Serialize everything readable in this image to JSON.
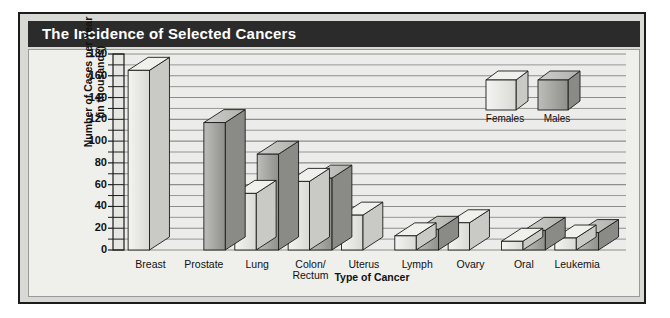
{
  "chart_data": {
    "type": "bar",
    "title": "The Incidence of Selected Cancers",
    "xlabel": "Type of Cancer",
    "ylabel": "Number of Cases per Year\n(in thousands)",
    "ylabel_line1": "Number of Cases per Year",
    "ylabel_line2": "(in thousands)",
    "categories": [
      "Breast",
      "Prostate",
      "Lung",
      "Colon/\nRectum",
      "Uterus",
      "Lymph",
      "Ovary",
      "Oral",
      "Leukemia"
    ],
    "category_labels": [
      {
        "line1": "Breast",
        "line2": ""
      },
      {
        "line1": "Prostate",
        "line2": ""
      },
      {
        "line1": "Lung",
        "line2": ""
      },
      {
        "line1": "Colon/",
        "line2": "Rectum"
      },
      {
        "line1": "Uterus",
        "line2": ""
      },
      {
        "line1": "Lymph",
        "line2": ""
      },
      {
        "line1": "Ovary",
        "line2": ""
      },
      {
        "line1": "Oral",
        "line2": ""
      },
      {
        "line1": "Leukemia",
        "line2": ""
      }
    ],
    "series": [
      {
        "name": "Females",
        "color": "#e4e4e0",
        "values": [
          165,
          null,
          52,
          63,
          32,
          13,
          25,
          8,
          11
        ]
      },
      {
        "name": "Males",
        "color": "#a8a8a4",
        "values": [
          null,
          117,
          88,
          66,
          null,
          19,
          null,
          18,
          16
        ]
      }
    ],
    "yticks": [
      0,
      20,
      40,
      60,
      80,
      100,
      120,
      140,
      160,
      180
    ],
    "ylim": [
      0,
      180
    ],
    "minor_tick_step": 10,
    "grid": true,
    "legend_position": "inside-top-right",
    "legend_entries": [
      "Females",
      "Males"
    ]
  },
  "colors": {
    "title_bar": "#2b2b2b",
    "title_text": "#ffffff",
    "figure_bg": "#d8d8d4",
    "panel_bg": "#efefec",
    "frame": "#1c1c1c",
    "gridline": "#8d8d89",
    "female_bar": "#e4e4e0",
    "male_bar": "#a8a8a4"
  }
}
